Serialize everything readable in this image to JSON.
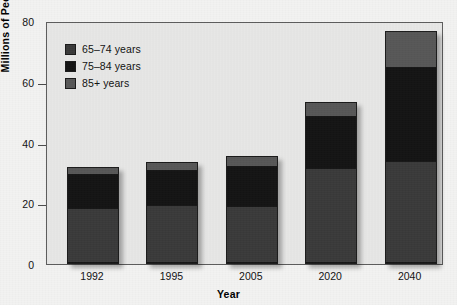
{
  "chart_data": {
    "type": "bar",
    "stacked": true,
    "title": "",
    "xlabel": "Year",
    "ylabel": "Millions of People",
    "categories": [
      "1992",
      "1995",
      "2005",
      "2020",
      "2040"
    ],
    "series": [
      {
        "name": "65–74 years",
        "color": "#3a3a3a",
        "values": [
          18,
          19,
          18.7,
          31.3,
          33.5
        ]
      },
      {
        "name": "75–84 years",
        "color": "#141414",
        "values": [
          11.5,
          12,
          13.5,
          17.4,
          31.3
        ]
      },
      {
        "name": "85+ years",
        "color": "#575757",
        "values": [
          2.5,
          2.5,
          3.3,
          4.6,
          11.8
        ]
      }
    ],
    "totals": [
      32,
      33.5,
      35.5,
      53.3,
      76.6
    ],
    "ylim": [
      0,
      80
    ],
    "yticks": [
      0,
      20,
      40,
      60,
      80
    ],
    "ytick_labels": [
      "0",
      "20",
      "40",
      "60",
      "80"
    ],
    "grid": false,
    "legend_position": "top-left",
    "plot_background": "#e9e9e8",
    "figure_background": "#f2f2f1",
    "axis_color": "#5d5d5d"
  }
}
